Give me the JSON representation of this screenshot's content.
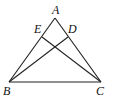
{
  "figure": {
    "points": {
      "A": {
        "label": "A",
        "x": 55,
        "y": 18,
        "lx": 52,
        "ly": 14
      },
      "B": {
        "label": "B",
        "x": 9,
        "y": 82,
        "lx": 3,
        "ly": 95
      },
      "C": {
        "label": "C",
        "x": 101,
        "y": 82,
        "lx": 96,
        "ly": 95
      },
      "D": {
        "label": "D",
        "x": 68,
        "y": 37,
        "lx": 68,
        "ly": 33
      },
      "E": {
        "label": "E",
        "x": 42,
        "y": 37,
        "lx": 34,
        "ly": 33
      }
    },
    "segments": [
      [
        "A",
        "B"
      ],
      [
        "A",
        "C"
      ],
      [
        "B",
        "C"
      ],
      [
        "B",
        "D"
      ],
      [
        "C",
        "E"
      ]
    ],
    "colors": {
      "stroke": "#222222",
      "label": "#111111",
      "background": "#ffffff"
    }
  }
}
